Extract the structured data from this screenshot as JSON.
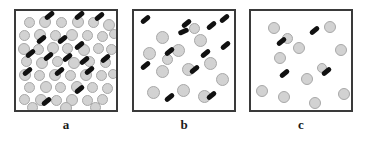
{
  "figure": {
    "type": "schematic-diagram",
    "background_color": "#ffffff",
    "circle_color": "#d2d2d2",
    "circle_edge_color": "#a8a8a8",
    "rod_color": "#111111",
    "panel_border_color": "#3a3a3a"
  },
  "panels": [
    {
      "label": "a",
      "x": 14,
      "circle_count": 48,
      "rod_count": 16,
      "circles": [
        {
          "x": 8,
          "y": 6,
          "d": 11
        },
        {
          "x": 23,
          "y": 5,
          "d": 12
        },
        {
          "x": 40,
          "y": 6,
          "d": 11
        },
        {
          "x": 56,
          "y": 5,
          "d": 12
        },
        {
          "x": 72,
          "y": 6,
          "d": 11
        },
        {
          "x": 87,
          "y": 8,
          "d": 12
        },
        {
          "x": 3,
          "y": 19,
          "d": 11
        },
        {
          "x": 18,
          "y": 18,
          "d": 12
        },
        {
          "x": 34,
          "y": 19,
          "d": 11
        },
        {
          "x": 50,
          "y": 18,
          "d": 12
        },
        {
          "x": 66,
          "y": 19,
          "d": 11
        },
        {
          "x": 81,
          "y": 20,
          "d": 11
        },
        {
          "x": 93,
          "y": 18,
          "d": 10
        },
        {
          "x": 2,
          "y": 32,
          "d": 12
        },
        {
          "x": 17,
          "y": 33,
          "d": 11
        },
        {
          "x": 31,
          "y": 31,
          "d": 12
        },
        {
          "x": 46,
          "y": 32,
          "d": 11
        },
        {
          "x": 62,
          "y": 33,
          "d": 12
        },
        {
          "x": 77,
          "y": 32,
          "d": 11
        },
        {
          "x": 90,
          "y": 33,
          "d": 11
        },
        {
          "x": 5,
          "y": 45,
          "d": 11
        },
        {
          "x": 20,
          "y": 46,
          "d": 12
        },
        {
          "x": 36,
          "y": 45,
          "d": 11
        },
        {
          "x": 52,
          "y": 46,
          "d": 12
        },
        {
          "x": 68,
          "y": 45,
          "d": 11
        },
        {
          "x": 84,
          "y": 46,
          "d": 11
        },
        {
          "x": 3,
          "y": 58,
          "d": 12
        },
        {
          "x": 18,
          "y": 59,
          "d": 11
        },
        {
          "x": 33,
          "y": 58,
          "d": 12
        },
        {
          "x": 49,
          "y": 59,
          "d": 11
        },
        {
          "x": 64,
          "y": 58,
          "d": 12
        },
        {
          "x": 80,
          "y": 59,
          "d": 11
        },
        {
          "x": 92,
          "y": 58,
          "d": 10
        },
        {
          "x": 8,
          "y": 71,
          "d": 11
        },
        {
          "x": 24,
          "y": 70,
          "d": 12
        },
        {
          "x": 39,
          "y": 71,
          "d": 11
        },
        {
          "x": 55,
          "y": 70,
          "d": 12
        },
        {
          "x": 71,
          "y": 71,
          "d": 11
        },
        {
          "x": 86,
          "y": 72,
          "d": 11
        },
        {
          "x": 3,
          "y": 83,
          "d": 11
        },
        {
          "x": 19,
          "y": 83,
          "d": 12
        },
        {
          "x": 35,
          "y": 84,
          "d": 11
        },
        {
          "x": 50,
          "y": 83,
          "d": 12
        },
        {
          "x": 66,
          "y": 84,
          "d": 11
        },
        {
          "x": 81,
          "y": 83,
          "d": 11
        },
        {
          "x": 11,
          "y": 91,
          "d": 11
        },
        {
          "x": 44,
          "y": 91,
          "d": 12
        },
        {
          "x": 74,
          "y": 91,
          "d": 11
        }
      ],
      "rods": [
        {
          "x": 28,
          "y": 2,
          "angle": -40
        },
        {
          "x": 58,
          "y": 2,
          "angle": -40
        },
        {
          "x": 78,
          "y": 3,
          "angle": -40
        },
        {
          "x": 20,
          "y": 26,
          "angle": -40
        },
        {
          "x": 41,
          "y": 26,
          "angle": -40
        },
        {
          "x": 58,
          "y": 32,
          "angle": -40
        },
        {
          "x": 9,
          "y": 40,
          "angle": -40
        },
        {
          "x": 27,
          "y": 43,
          "angle": -40
        },
        {
          "x": 46,
          "y": 44,
          "angle": -40
        },
        {
          "x": 63,
          "y": 47,
          "angle": -40
        },
        {
          "x": 84,
          "y": 45,
          "angle": -40
        },
        {
          "x": 6,
          "y": 58,
          "angle": -40
        },
        {
          "x": 38,
          "y": 58,
          "angle": -40
        },
        {
          "x": 68,
          "y": 57,
          "angle": -40
        },
        {
          "x": 58,
          "y": 76,
          "angle": -40
        },
        {
          "x": 25,
          "y": 88,
          "angle": -40
        }
      ]
    },
    {
      "label": "b",
      "x": 132,
      "circle_count": 13,
      "rod_count": 12,
      "circles": [
        {
          "x": 22,
          "y": 20,
          "d": 13
        },
        {
          "x": 60,
          "y": 23,
          "d": 13
        },
        {
          "x": 9,
          "y": 36,
          "d": 13
        },
        {
          "x": 38,
          "y": 33,
          "d": 13
        },
        {
          "x": 28,
          "y": 43,
          "d": 11
        },
        {
          "x": 70,
          "y": 46,
          "d": 13
        },
        {
          "x": 22,
          "y": 54,
          "d": 13
        },
        {
          "x": 48,
          "y": 52,
          "d": 13
        },
        {
          "x": 82,
          "y": 62,
          "d": 13
        },
        {
          "x": 13,
          "y": 75,
          "d": 13
        },
        {
          "x": 43,
          "y": 73,
          "d": 13
        },
        {
          "x": 64,
          "y": 79,
          "d": 13
        },
        {
          "x": 55,
          "y": 12,
          "d": 11
        }
      ],
      "rods": [
        {
          "x": 6,
          "y": 6,
          "angle": -40
        },
        {
          "x": 47,
          "y": 10,
          "angle": -40
        },
        {
          "x": 44,
          "y": 18,
          "angle": -25
        },
        {
          "x": 72,
          "y": 12,
          "angle": -40
        },
        {
          "x": 85,
          "y": 5,
          "angle": -40
        },
        {
          "x": 30,
          "y": 38,
          "angle": -40
        },
        {
          "x": 86,
          "y": 32,
          "angle": -40
        },
        {
          "x": 6,
          "y": 52,
          "angle": -40
        },
        {
          "x": 66,
          "y": 40,
          "angle": -40
        },
        {
          "x": 55,
          "y": 56,
          "angle": -40
        },
        {
          "x": 30,
          "y": 84,
          "angle": -40
        },
        {
          "x": 72,
          "y": 82,
          "angle": -40
        }
      ]
    },
    {
      "label": "c",
      "x": 249,
      "circle_count": 12,
      "rod_count": 4,
      "circles": [
        {
          "x": 17,
          "y": 11,
          "d": 12
        },
        {
          "x": 73,
          "y": 10,
          "d": 12
        },
        {
          "x": 42,
          "y": 31,
          "d": 12
        },
        {
          "x": 84,
          "y": 33,
          "d": 12
        },
        {
          "x": 23,
          "y": 41,
          "d": 12
        },
        {
          "x": 50,
          "y": 62,
          "d": 12
        },
        {
          "x": 5,
          "y": 74,
          "d": 12
        },
        {
          "x": 27,
          "y": 80,
          "d": 12
        },
        {
          "x": 58,
          "y": 86,
          "d": 12
        },
        {
          "x": 87,
          "y": 77,
          "d": 12
        },
        {
          "x": 31,
          "y": 22,
          "d": 11
        },
        {
          "x": 66,
          "y": 52,
          "d": 10
        }
      ],
      "rods": [
        {
          "x": 58,
          "y": 17,
          "angle": -40
        },
        {
          "x": 25,
          "y": 28,
          "angle": -40
        },
        {
          "x": 28,
          "y": 60,
          "angle": -40
        },
        {
          "x": 70,
          "y": 58,
          "angle": -40
        }
      ]
    }
  ]
}
